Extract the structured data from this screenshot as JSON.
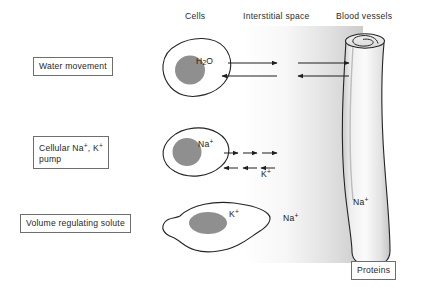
{
  "figure": {
    "headers": {
      "cells": "Cells",
      "interstitial": "Interstitial space",
      "blood": "Blood vessels"
    },
    "labels": {
      "water_movement": "Water movement",
      "pump": "Cellular Na+, K+\npump",
      "volume_solute": "Volume regulating solute",
      "proteins": "Proteins"
    },
    "annotations": {
      "water_in_cell": "H2O",
      "sodium_in_cell": "Na+",
      "potassium_in_cell": "K+",
      "potassium_arrow": "K+",
      "sodium_interstitial": "Na+",
      "sodium_vessel": "Na+"
    },
    "colors": {
      "outline": "#262626",
      "nucleus": "#8f8f8f",
      "vessel_fill": "#e4e4e4",
      "interstitial_gradient_start": "#ffffff",
      "interstitial_gradient_end": "#cfcfcf",
      "box_border": "#6e6e6e",
      "background": "#ffffff"
    },
    "rows": [
      {
        "name": "water-movement-row",
        "label": "Water movement",
        "arrow_count": 4
      },
      {
        "name": "sodium-potassium-pump-row",
        "label": "Cellular Na+, K+ pump",
        "arrow_count": 6
      },
      {
        "name": "volume-regulating-solute-row",
        "label": "Volume regulating solute",
        "arrow_count": 0
      }
    ]
  }
}
